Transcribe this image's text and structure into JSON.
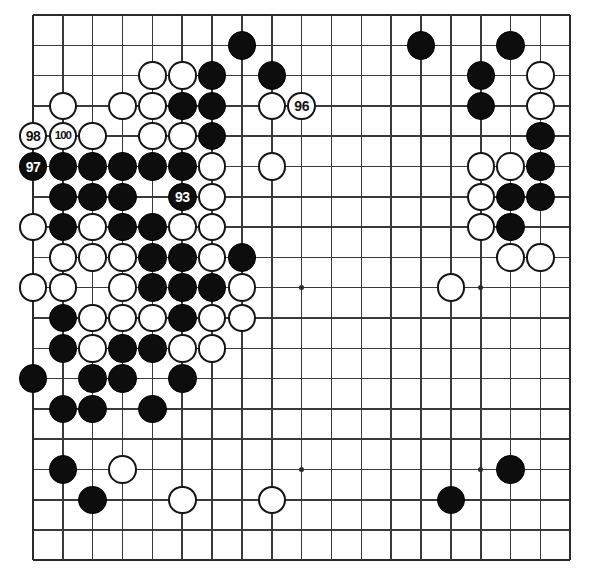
{
  "figure": {
    "kind": "go-board-diagram",
    "board_size": 19,
    "caption": "",
    "colors": {
      "background": "#ffffff",
      "line": "#3a3a3a",
      "black_stone": "#0d0d0d",
      "white_stone": "#ffffff",
      "stone_outline": "#141414",
      "black_label_text": "#ffffff",
      "white_label_text": "#141414"
    },
    "geometry": {
      "origin_x": 33,
      "origin_y": 15,
      "step_x": 29.85,
      "step_y": 30.3,
      "stone_diameter": 28.5
    },
    "star_points": [
      [
        4,
        4
      ],
      [
        10,
        4
      ],
      [
        16,
        4
      ],
      [
        4,
        10
      ],
      [
        10,
        10
      ],
      [
        16,
        10
      ],
      [
        4,
        16
      ],
      [
        10,
        16
      ],
      [
        16,
        16
      ]
    ]
  },
  "move_labels": {
    "93": "93",
    "96": "96",
    "97": "97",
    "98": "98",
    "100": "100"
  },
  "stones": [
    {
      "col": 8,
      "row": 2,
      "color": "black",
      "label": ""
    },
    {
      "col": 14,
      "row": 2,
      "color": "black",
      "label": ""
    },
    {
      "col": 17,
      "row": 2,
      "color": "black",
      "label": ""
    },
    {
      "col": 5,
      "row": 3,
      "color": "white",
      "label": ""
    },
    {
      "col": 6,
      "row": 3,
      "color": "white",
      "label": ""
    },
    {
      "col": 7,
      "row": 3,
      "color": "black",
      "label": ""
    },
    {
      "col": 9,
      "row": 3,
      "color": "black",
      "label": ""
    },
    {
      "col": 16,
      "row": 3,
      "color": "black",
      "label": ""
    },
    {
      "col": 18,
      "row": 3,
      "color": "white",
      "label": ""
    },
    {
      "col": 2,
      "row": 4,
      "color": "white",
      "label": ""
    },
    {
      "col": 4,
      "row": 4,
      "color": "white",
      "label": ""
    },
    {
      "col": 5,
      "row": 4,
      "color": "white",
      "label": ""
    },
    {
      "col": 6,
      "row": 4,
      "color": "black",
      "label": ""
    },
    {
      "col": 7,
      "row": 4,
      "color": "black",
      "label": ""
    },
    {
      "col": 9,
      "row": 4,
      "color": "white",
      "label": ""
    },
    {
      "col": 10,
      "row": 4,
      "color": "white",
      "label": "96"
    },
    {
      "col": 16,
      "row": 4,
      "color": "black",
      "label": ""
    },
    {
      "col": 18,
      "row": 4,
      "color": "white",
      "label": ""
    },
    {
      "col": 1,
      "row": 5,
      "color": "white",
      "label": "98"
    },
    {
      "col": 2,
      "row": 5,
      "color": "white",
      "label": "100"
    },
    {
      "col": 3,
      "row": 5,
      "color": "white",
      "label": ""
    },
    {
      "col": 5,
      "row": 5,
      "color": "white",
      "label": ""
    },
    {
      "col": 6,
      "row": 5,
      "color": "white",
      "label": ""
    },
    {
      "col": 7,
      "row": 5,
      "color": "black",
      "label": ""
    },
    {
      "col": 18,
      "row": 5,
      "color": "black",
      "label": ""
    },
    {
      "col": 1,
      "row": 6,
      "color": "black",
      "label": "97"
    },
    {
      "col": 2,
      "row": 6,
      "color": "black",
      "label": ""
    },
    {
      "col": 3,
      "row": 6,
      "color": "black",
      "label": ""
    },
    {
      "col": 4,
      "row": 6,
      "color": "black",
      "label": ""
    },
    {
      "col": 5,
      "row": 6,
      "color": "black",
      "label": ""
    },
    {
      "col": 6,
      "row": 6,
      "color": "black",
      "label": ""
    },
    {
      "col": 7,
      "row": 6,
      "color": "white",
      "label": ""
    },
    {
      "col": 9,
      "row": 6,
      "color": "white",
      "label": ""
    },
    {
      "col": 16,
      "row": 6,
      "color": "white",
      "label": ""
    },
    {
      "col": 17,
      "row": 6,
      "color": "white",
      "label": ""
    },
    {
      "col": 18,
      "row": 6,
      "color": "black",
      "label": ""
    },
    {
      "col": 2,
      "row": 7,
      "color": "black",
      "label": ""
    },
    {
      "col": 3,
      "row": 7,
      "color": "black",
      "label": ""
    },
    {
      "col": 4,
      "row": 7,
      "color": "black",
      "label": ""
    },
    {
      "col": 6,
      "row": 7,
      "color": "black",
      "label": "93"
    },
    {
      "col": 7,
      "row": 7,
      "color": "white",
      "label": ""
    },
    {
      "col": 16,
      "row": 7,
      "color": "white",
      "label": ""
    },
    {
      "col": 17,
      "row": 7,
      "color": "black",
      "label": ""
    },
    {
      "col": 18,
      "row": 7,
      "color": "black",
      "label": ""
    },
    {
      "col": 1,
      "row": 8,
      "color": "white",
      "label": ""
    },
    {
      "col": 2,
      "row": 8,
      "color": "black",
      "label": ""
    },
    {
      "col": 3,
      "row": 8,
      "color": "white",
      "label": ""
    },
    {
      "col": 4,
      "row": 8,
      "color": "black",
      "label": ""
    },
    {
      "col": 5,
      "row": 8,
      "color": "black",
      "label": ""
    },
    {
      "col": 6,
      "row": 8,
      "color": "white",
      "label": ""
    },
    {
      "col": 7,
      "row": 8,
      "color": "white",
      "label": ""
    },
    {
      "col": 16,
      "row": 8,
      "color": "white",
      "label": ""
    },
    {
      "col": 17,
      "row": 8,
      "color": "black",
      "label": ""
    },
    {
      "col": 2,
      "row": 9,
      "color": "white",
      "label": ""
    },
    {
      "col": 3,
      "row": 9,
      "color": "white",
      "label": ""
    },
    {
      "col": 4,
      "row": 9,
      "color": "white",
      "label": ""
    },
    {
      "col": 5,
      "row": 9,
      "color": "black",
      "label": ""
    },
    {
      "col": 6,
      "row": 9,
      "color": "black",
      "label": ""
    },
    {
      "col": 7,
      "row": 9,
      "color": "white",
      "label": ""
    },
    {
      "col": 8,
      "row": 9,
      "color": "black",
      "label": ""
    },
    {
      "col": 17,
      "row": 9,
      "color": "white",
      "label": ""
    },
    {
      "col": 18,
      "row": 9,
      "color": "white",
      "label": ""
    },
    {
      "col": 1,
      "row": 10,
      "color": "white",
      "label": ""
    },
    {
      "col": 2,
      "row": 10,
      "color": "white",
      "label": ""
    },
    {
      "col": 4,
      "row": 10,
      "color": "white",
      "label": ""
    },
    {
      "col": 5,
      "row": 10,
      "color": "black",
      "label": ""
    },
    {
      "col": 6,
      "row": 10,
      "color": "black",
      "label": ""
    },
    {
      "col": 7,
      "row": 10,
      "color": "black",
      "label": ""
    },
    {
      "col": 8,
      "row": 10,
      "color": "white",
      "label": ""
    },
    {
      "col": 15,
      "row": 10,
      "color": "white",
      "label": ""
    },
    {
      "col": 2,
      "row": 11,
      "color": "black",
      "label": ""
    },
    {
      "col": 3,
      "row": 11,
      "color": "white",
      "label": ""
    },
    {
      "col": 4,
      "row": 11,
      "color": "white",
      "label": ""
    },
    {
      "col": 5,
      "row": 11,
      "color": "white",
      "label": ""
    },
    {
      "col": 6,
      "row": 11,
      "color": "black",
      "label": ""
    },
    {
      "col": 7,
      "row": 11,
      "color": "white",
      "label": ""
    },
    {
      "col": 8,
      "row": 11,
      "color": "white",
      "label": ""
    },
    {
      "col": 2,
      "row": 12,
      "color": "black",
      "label": ""
    },
    {
      "col": 3,
      "row": 12,
      "color": "white",
      "label": ""
    },
    {
      "col": 4,
      "row": 12,
      "color": "black",
      "label": ""
    },
    {
      "col": 5,
      "row": 12,
      "color": "black",
      "label": ""
    },
    {
      "col": 6,
      "row": 12,
      "color": "white",
      "label": ""
    },
    {
      "col": 7,
      "row": 12,
      "color": "white",
      "label": ""
    },
    {
      "col": 1,
      "row": 13,
      "color": "black",
      "label": ""
    },
    {
      "col": 3,
      "row": 13,
      "color": "black",
      "label": ""
    },
    {
      "col": 4,
      "row": 13,
      "color": "black",
      "label": ""
    },
    {
      "col": 6,
      "row": 13,
      "color": "black",
      "label": ""
    },
    {
      "col": 2,
      "row": 14,
      "color": "black",
      "label": ""
    },
    {
      "col": 3,
      "row": 14,
      "color": "black",
      "label": ""
    },
    {
      "col": 5,
      "row": 14,
      "color": "black",
      "label": ""
    },
    {
      "col": 2,
      "row": 16,
      "color": "black",
      "label": ""
    },
    {
      "col": 4,
      "row": 16,
      "color": "white",
      "label": ""
    },
    {
      "col": 17,
      "row": 16,
      "color": "black",
      "label": ""
    },
    {
      "col": 3,
      "row": 17,
      "color": "black",
      "label": ""
    },
    {
      "col": 6,
      "row": 17,
      "color": "white",
      "label": ""
    },
    {
      "col": 9,
      "row": 17,
      "color": "white",
      "label": ""
    },
    {
      "col": 15,
      "row": 17,
      "color": "black",
      "label": ""
    }
  ]
}
